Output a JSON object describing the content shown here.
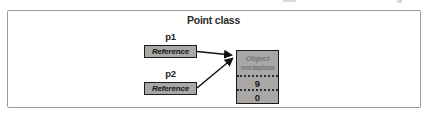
{
  "diagram": {
    "title": "Point class",
    "pointers": [
      {
        "name": "p1",
        "box_label": "Reference"
      },
      {
        "name": "p2",
        "box_label": "Reference"
      }
    ],
    "object": {
      "header": "Object metadata",
      "fields": [
        "9",
        "0"
      ]
    },
    "colors": {
      "box_fill": "#a9a8a6",
      "box_border": "#1c1c1c",
      "frame_border": "#9b9b9b",
      "metadata_text": "#787878",
      "arrow": "#111111"
    }
  }
}
